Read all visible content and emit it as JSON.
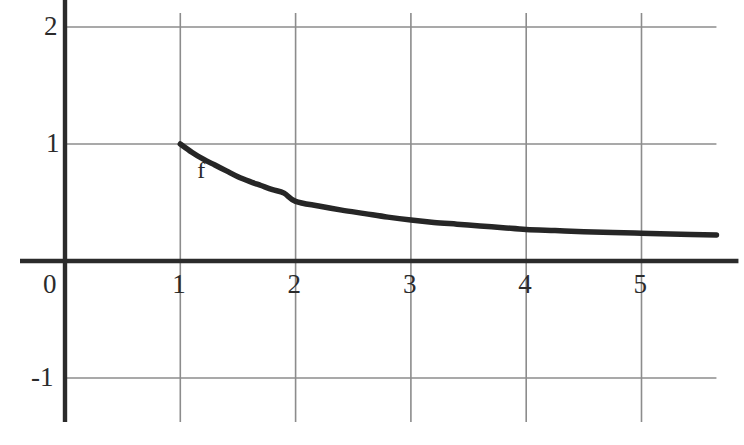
{
  "figure": {
    "background_color": "#ffffff",
    "axis_color": "#2b2b2b",
    "grid_color": "#8c8c8c",
    "curve_color": "#262626",
    "text_color": "#2b2b2b"
  },
  "axes": {
    "x_tick_labels": [
      "0",
      "1",
      "2",
      "3",
      "4",
      "5"
    ],
    "x_tick_values": [
      0,
      1,
      2,
      3,
      4,
      5
    ],
    "y_tick_labels": [
      "2",
      "1",
      "-1"
    ],
    "y_tick_values": [
      2,
      1,
      -1
    ]
  },
  "annotations": {
    "curve_label": "f"
  },
  "chart_data": {
    "type": "line",
    "title": "",
    "xlabel": "",
    "ylabel": "",
    "xlim": [
      -0.4,
      5.65
    ],
    "ylim": [
      -1.35,
      2.12
    ],
    "grid": true,
    "grid_x_lines": [
      1,
      2,
      3,
      4,
      5
    ],
    "grid_y_lines": [
      2,
      1,
      -1
    ],
    "legend": "none",
    "series": [
      {
        "name": "f",
        "label": "f",
        "label_x": 1.2,
        "label_y": 0.78,
        "description": "decreasing convex curve starting at (1, 1) and flattening toward a value near 0.22",
        "x": [
          1.0,
          1.1,
          1.2,
          1.3,
          1.4,
          1.5,
          1.6,
          1.7,
          1.8,
          1.9,
          2.0,
          2.2,
          2.4,
          2.6,
          2.8,
          3.0,
          3.2,
          3.4,
          3.6,
          3.8,
          4.0,
          4.25,
          4.5,
          4.75,
          5.0,
          5.25,
          5.65
        ],
        "y": [
          1.0,
          0.93,
          0.87,
          0.82,
          0.77,
          0.72,
          0.68,
          0.645,
          0.61,
          0.58,
          0.51,
          0.47,
          0.435,
          0.405,
          0.375,
          0.35,
          0.33,
          0.315,
          0.3,
          0.285,
          0.27,
          0.26,
          0.25,
          0.243,
          0.237,
          0.231,
          0.222
        ]
      }
    ]
  }
}
